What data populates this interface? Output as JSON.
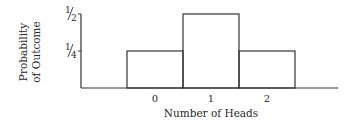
{
  "chart_data": {
    "type": "bar",
    "title": "",
    "xlabel": "Number of Heads",
    "ylabel": "Probability of Outcome",
    "ylabel_lines": [
      "Probability",
      "of Outcome"
    ],
    "categories": [
      "0",
      "1",
      "2"
    ],
    "values": [
      0.25,
      0.5,
      0.25
    ],
    "y_ticks": [
      {
        "value": 0.25,
        "label_num": "1",
        "label_den": "4"
      },
      {
        "value": 0.5,
        "label_num": "1",
        "label_den": "2"
      }
    ],
    "ylim": [
      0,
      0.5
    ],
    "grid": false,
    "legend": null,
    "bar_style": "outlined histogram, adjacent bars, no fill"
  }
}
